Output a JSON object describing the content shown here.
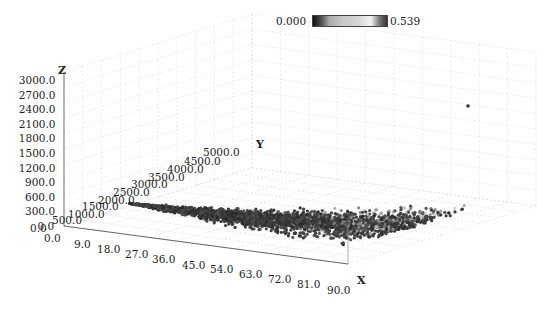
{
  "chart_data": {
    "type": "scatter",
    "dimensionality": "3d",
    "title": "",
    "axes": {
      "x": {
        "label": "X",
        "ticks": [
          "0.0",
          "9.0",
          "18.0",
          "27.0",
          "36.0",
          "45.0",
          "54.0",
          "63.0",
          "72.0",
          "81.0",
          "90.0"
        ],
        "range": [
          0,
          90
        ]
      },
      "y": {
        "label": "Y",
        "ticks": [
          "0.0",
          "500.0",
          "1000.0",
          "1500.0",
          "2000.0",
          "2500.0",
          "3000.0",
          "3500.0",
          "4000.0",
          "4500.0",
          "5000.0"
        ],
        "range": [
          0,
          5000
        ]
      },
      "z": {
        "label": "Z",
        "ticks": [
          "0.0",
          "300.0",
          "600.0",
          "900.0",
          "1200.0",
          "1500.0",
          "1800.0",
          "2100.0",
          "2400.0",
          "2700.0",
          "3000.0"
        ],
        "range": [
          0,
          3000
        ]
      }
    },
    "grid": true,
    "colorbar": {
      "min": "0.000",
      "max": "0.539",
      "colormap": "grayscale",
      "position": "top-right"
    },
    "series_description": "Dense point cloud concentrated at low Z along X, rising in Z with increasing X (curving up near X=80-90), with an isolated outlier point high to the right.",
    "point_count_estimate": 6000,
    "outlier": {
      "screen_x": 468,
      "screen_y": 106
    }
  },
  "colorbar": {
    "min_label": "0.000",
    "max_label": "0.539"
  },
  "labels": {
    "x_axis_title": "X",
    "y_axis_title": "Y",
    "z_axis_title": "Z"
  }
}
